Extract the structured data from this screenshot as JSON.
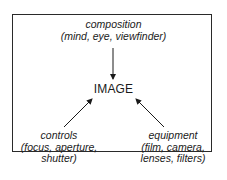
{
  "diagram": {
    "title": "IMAGE",
    "nodes": [
      {
        "id": "composition",
        "heading": "composition",
        "details": "(mind, eye, viewfinder)",
        "position": "top"
      },
      {
        "id": "controls",
        "heading": "controls",
        "details_lines": [
          "(focus, aperture,",
          "shutter)"
        ],
        "position": "bottom-left"
      },
      {
        "id": "equipment",
        "heading": "equipment",
        "details_lines": [
          "(film, camera,",
          "lenses, filters)"
        ],
        "position": "bottom-right"
      }
    ],
    "edges": [
      {
        "from": "composition",
        "to": "IMAGE"
      },
      {
        "from": "controls",
        "to": "IMAGE"
      },
      {
        "from": "equipment",
        "to": "IMAGE"
      }
    ]
  },
  "colors": {
    "border": "#2a2a2a",
    "text": "#1a1a1a",
    "background": "#ffffff"
  }
}
